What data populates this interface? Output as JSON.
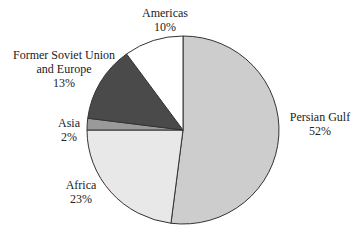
{
  "chart_data": {
    "type": "pie",
    "title": "",
    "slices": [
      {
        "label": "Persian Gulf",
        "value": 52,
        "pct_label": "52%",
        "color": "#cdcdcd"
      },
      {
        "label": "Africa",
        "value": 23,
        "pct_label": "23%",
        "color": "#e8e8e8"
      },
      {
        "label": "Asia",
        "value": 2,
        "pct_label": "2%",
        "color": "#9a9a9a"
      },
      {
        "label": "Former Soviet Union and Europe",
        "value": 13,
        "pct_label": "13%",
        "color": "#4a4a4a"
      },
      {
        "label": "Americas",
        "value": 10,
        "pct_label": "10%",
        "color": "#ffffff"
      }
    ],
    "start_angle_deg": 0,
    "direction": "clockwise"
  },
  "labels": {
    "persian_gulf": {
      "name": "Persian Gulf",
      "pct": "52%"
    },
    "africa": {
      "name": "Africa",
      "pct": "23%"
    },
    "asia": {
      "name": "Asia",
      "pct": "2%"
    },
    "fsu": {
      "name1": "Former Soviet Union",
      "name2": "and Europe",
      "pct": "13%"
    },
    "americas": {
      "name": "Americas",
      "pct": "10%"
    }
  }
}
